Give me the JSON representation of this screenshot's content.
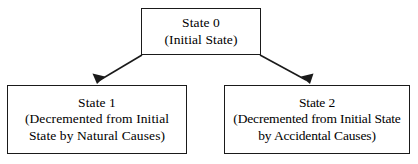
{
  "diagram": {
    "type": "state-transition-tree",
    "background_color": "#ffffff",
    "stroke_color": "#1a1a1a",
    "nodes": [
      {
        "id": "state-0",
        "lines": [
          "State 0",
          "(Initial State)"
        ]
      },
      {
        "id": "state-1",
        "lines": [
          "State 1",
          "(Decremented from Initial",
          "State by Natural Causes)"
        ]
      },
      {
        "id": "state-2",
        "lines": [
          "State 2",
          "(Decremented from Initial State",
          "by Accidental Causes)"
        ]
      }
    ],
    "edges": [
      {
        "id": "edge-state0-to-state1",
        "from": "state-0",
        "to": "state-1",
        "label": ""
      },
      {
        "id": "edge-state0-to-state2",
        "from": "state-0",
        "to": "state-2",
        "label": ""
      }
    ]
  }
}
